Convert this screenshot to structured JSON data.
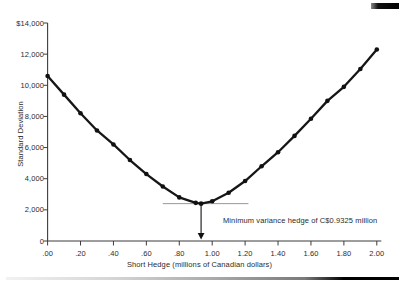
{
  "chart_data": {
    "type": "line",
    "title": "",
    "xlabel": "Short Hedge (millions of Canadian dollars)",
    "ylabel": "Standard Deviation",
    "xlim": [
      0,
      2.0
    ],
    "ylim": [
      0,
      14000
    ],
    "grid": false,
    "legend": "none",
    "x_tick_labels": [
      ".00",
      ".20",
      ".40",
      ".60",
      ".80",
      "1.00",
      "1.20",
      "1.40",
      "1.60",
      "1.80",
      "2.00"
    ],
    "x_tick_values": [
      0,
      0.2,
      0.4,
      0.6,
      0.8,
      1.0,
      1.2,
      1.4,
      1.6,
      1.8,
      2.0
    ],
    "y_tick_labels": [
      "$14,000",
      "12,000",
      "10,000",
      "8,000",
      "6,000",
      "4,000",
      "2,000",
      "0"
    ],
    "y_tick_values": [
      14000,
      12000,
      10000,
      8000,
      6000,
      4000,
      2000,
      0
    ],
    "series": [
      {
        "name": "standard deviation of hedged position",
        "marker": "point",
        "x": [
          0.0,
          0.1,
          0.2,
          0.3,
          0.4,
          0.5,
          0.6,
          0.7,
          0.8,
          0.9,
          0.9325,
          1.0,
          1.1,
          1.2,
          1.3,
          1.4,
          1.5,
          1.6,
          1.7,
          1.8,
          1.9,
          2.0
        ],
        "y": [
          10600,
          9400,
          8200,
          7100,
          6200,
          5200,
          4300,
          3500,
          2800,
          2450,
          2400,
          2550,
          3100,
          3850,
          4800,
          5700,
          6750,
          7850,
          9000,
          9900,
          11050,
          12300
        ]
      }
    ],
    "annotation": {
      "label": "Minimum variance hedge of C$0.9325 million",
      "arrow_x": 0.9325,
      "ref_line_level": 2400,
      "ref_line_x_range": [
        0.7,
        1.22
      ]
    },
    "colors": {
      "line": "#161616",
      "marker": "#111111",
      "axis": "#3c3c3c",
      "text": "#2b2b2b",
      "ref_line": "#8c8c8c",
      "arrow": "#111111"
    }
  }
}
